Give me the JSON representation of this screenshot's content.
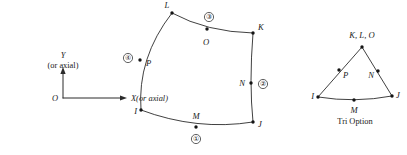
{
  "figure": {
    "stroke_color": "#2b2b2b",
    "node_color": "#141414",
    "background_color": "#ffffff"
  },
  "axes": {
    "origin_label": "O",
    "y_label": "Y",
    "y_sublabel": "(or axial)",
    "x_label": "X(or axial)"
  },
  "quad": {
    "corner_labels": {
      "top_left": "L",
      "top_right": "K",
      "bottom_right": "J",
      "bottom_left": "I"
    },
    "midside_labels": {
      "top": "O",
      "right": "N",
      "bottom": "M",
      "left": "P"
    },
    "edge_numbers": {
      "bottom": "①",
      "right": "②",
      "top": "③",
      "left": "④"
    }
  },
  "tri": {
    "apex_label": "K, L, O",
    "left_corner_label": "I",
    "right_corner_label": "J",
    "base_mid_label": "M",
    "left_mid_label": "P",
    "right_mid_label": "N",
    "caption": "Tri Option"
  }
}
